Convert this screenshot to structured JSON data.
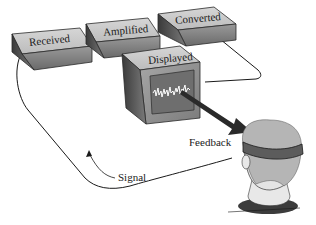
{
  "diagram": {
    "type": "biofeedback-loop",
    "stages": [
      {
        "id": "received",
        "label": "Received"
      },
      {
        "id": "amplified",
        "label": "Amplified"
      },
      {
        "id": "converted",
        "label": "Converted"
      },
      {
        "id": "displayed",
        "label": "Displayed"
      }
    ],
    "arrows": [
      {
        "label": "Feedback",
        "from": "displayed",
        "to": "person"
      },
      {
        "label": "Signal",
        "from": "person",
        "to": "received"
      }
    ],
    "colors": {
      "box_top": "#c8c8c8",
      "box_front": "#8a8a8a",
      "box_side": "#5a5a5a",
      "screen": "#6e6e6e",
      "waveform": "#ffffff",
      "hair": "#b5b5b5",
      "headband": "#5c5c5c",
      "collar": "#3c3c3c",
      "line": "#1a1a1a"
    }
  }
}
